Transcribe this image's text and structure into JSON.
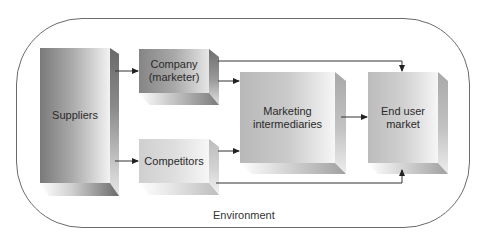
{
  "diagram": {
    "environment_label": "Environment",
    "nodes": {
      "suppliers": {
        "label": "Suppliers"
      },
      "company": {
        "label_line1": "Company",
        "label_line2": "(marketer)"
      },
      "competitors": {
        "label": "Competitors"
      },
      "intermediaries": {
        "label_line1": "Marketing",
        "label_line2": "intermediaries"
      },
      "end_user": {
        "label_line1": "End user",
        "label_line2": "market"
      }
    },
    "edges": [
      {
        "from": "Suppliers",
        "to": "Company (marketer)"
      },
      {
        "from": "Suppliers",
        "to": "Competitors"
      },
      {
        "from": "Company (marketer)",
        "to": "Marketing intermediaries"
      },
      {
        "from": "Competitors",
        "to": "Marketing intermediaries"
      },
      {
        "from": "Marketing intermediaries",
        "to": "End user market"
      },
      {
        "from": "Company (marketer)",
        "to": "End user market"
      },
      {
        "from": "Competitors",
        "to": "End user market"
      }
    ],
    "colors": {
      "border": "#6a6a6a",
      "dark_gray": "#7d7d7d",
      "light_gray": "#f4f4f4",
      "arrow": "#222222"
    }
  }
}
